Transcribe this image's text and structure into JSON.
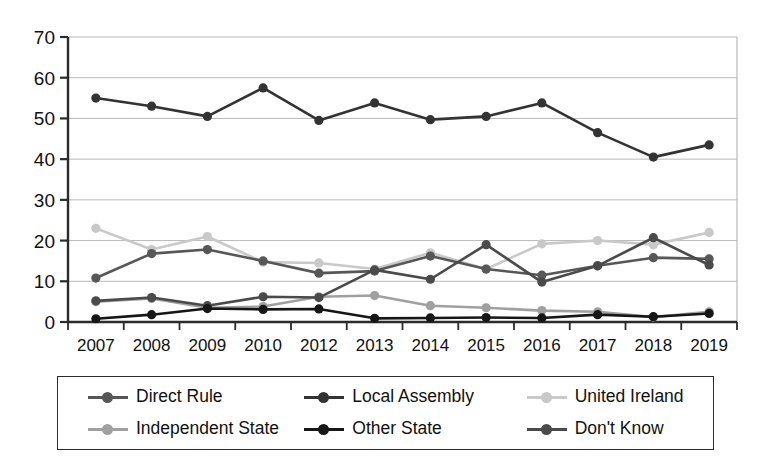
{
  "chart_data": {
    "type": "line",
    "title": "",
    "subtitle": "",
    "xlabel": "",
    "ylabel": "",
    "xlim": [
      2007,
      2019
    ],
    "ylim": [
      0,
      70
    ],
    "yticks": [
      0,
      10,
      20,
      30,
      40,
      50,
      60,
      70
    ],
    "grid": true,
    "legend_position": "bottom",
    "categories": [
      "2007",
      "2008",
      "2009",
      "2010",
      "2012",
      "2013",
      "2014",
      "2015",
      "2016",
      "2017",
      "2018",
      "2019"
    ],
    "series": [
      {
        "name": "Direct Rule",
        "color": "#575757",
        "values": [
          10.8,
          16.8,
          17.8,
          15.0,
          12.0,
          12.5,
          16.2,
          13.0,
          11.5,
          13.8,
          15.8,
          15.5
        ]
      },
      {
        "name": "Local Assembly",
        "color": "#333333",
        "values": [
          55.0,
          53.0,
          50.5,
          57.5,
          49.5,
          53.8,
          49.7,
          50.5,
          53.8,
          46.5,
          40.5,
          43.5
        ]
      },
      {
        "name": "United Ireland",
        "color": "#c9c9c9",
        "values": [
          23.0,
          17.8,
          21.0,
          14.7,
          14.5,
          13.0,
          17.0,
          13.0,
          19.2,
          20.0,
          19.0,
          22.0
        ]
      },
      {
        "name": "Independent State",
        "color": "#a0a0a0",
        "values": [
          5.0,
          5.8,
          3.5,
          3.8,
          6.2,
          6.5,
          4.0,
          3.5,
          2.8,
          2.5,
          1.2,
          2.5
        ]
      },
      {
        "name": "Other State",
        "color": "#161616",
        "values": [
          0.8,
          1.8,
          3.3,
          3.1,
          3.2,
          0.9,
          1.0,
          1.1,
          1.0,
          1.8,
          1.3,
          2.1
        ]
      },
      {
        "name": "Don't Know",
        "color": "#4a4a4a",
        "values": [
          5.2,
          6.0,
          4.0,
          6.2,
          6.0,
          12.8,
          10.5,
          19.0,
          9.8,
          13.8,
          20.7,
          14.0
        ]
      }
    ]
  },
  "axes": {
    "y_tick_labels": [
      "70",
      "60",
      "50",
      "40",
      "30",
      "20",
      "10",
      "0"
    ],
    "x_tick_labels": [
      "2007",
      "2008",
      "2009",
      "2010",
      "2012",
      "2013",
      "2014",
      "2015",
      "2016",
      "2017",
      "2018",
      "2019"
    ]
  },
  "legend": {
    "rows": [
      [
        {
          "label": "Direct Rule",
          "color": "#575757"
        },
        {
          "label": "Local Assembly",
          "color": "#333333"
        },
        {
          "label": "United Ireland",
          "color": "#c9c9c9"
        }
      ],
      [
        {
          "label": "Independent State",
          "color": "#a0a0a0"
        },
        {
          "label": "Other State",
          "color": "#161616"
        },
        {
          "label": "Don't Know",
          "color": "#4a4a4a"
        }
      ]
    ]
  },
  "style": {
    "axis_color": "#2b2b2b",
    "grid_color": "#b9b9b9",
    "background": "#ffffff"
  }
}
